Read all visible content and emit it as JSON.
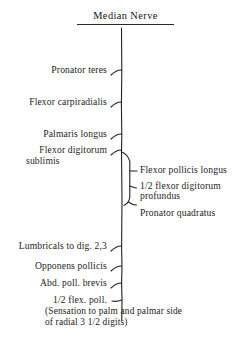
{
  "diagram": {
    "title": "Median Nerve",
    "type": "nerve-branching-chart",
    "line_color": "#222222",
    "background_color": "#ffffff",
    "text_color": "#1c1c1c",
    "left_branches": [
      {
        "id": "pronator-teres",
        "label": "Pronator teres"
      },
      {
        "id": "flexor-carpiradialis",
        "label": "Flexor carpiradialis"
      },
      {
        "id": "palmaris-longus",
        "label": "Palmaris longus"
      },
      {
        "id": "flexor-digitorum-sublimis-line1",
        "label": "Flexor digitorum"
      },
      {
        "id": "flexor-digitorum-sublimis-line2",
        "label": "sublimis"
      },
      {
        "id": "lumbricals",
        "label": "Lumbricals to dig. 2,3"
      },
      {
        "id": "opponens-pollicis",
        "label": "Opponens pollicis"
      },
      {
        "id": "abd-poll-brevis",
        "label": "Abd. poll. brevis"
      },
      {
        "id": "half-flex-poll",
        "label": "1/2 flex. poll."
      }
    ],
    "right_branches": [
      {
        "id": "flexor-pollicis-longus",
        "label": "Flexor pollicis longus"
      },
      {
        "id": "half-flexor-digitorum-profundus-line1",
        "label": "1/2 flexor digitorum"
      },
      {
        "id": "half-flexor-digitorum-profundus-line2",
        "label": "profundus"
      },
      {
        "id": "pronator-quadratus",
        "label": "Pronator quadratus"
      }
    ],
    "sensory_note": {
      "line1": "(Sensation to palm and palmar side",
      "line2": "of radial 3 1/2 digits)"
    }
  }
}
